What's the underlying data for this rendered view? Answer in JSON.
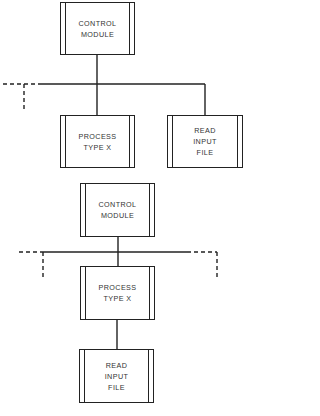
{
  "diagram_1": {
    "root": {
      "lines": [
        "CONTROL",
        "MODULE"
      ]
    },
    "children": [
      {
        "lines": [
          "PROCESS",
          "TYPE X"
        ]
      },
      {
        "lines": [
          "READ",
          "INPUT",
          "FILE"
        ]
      }
    ]
  },
  "diagram_2": {
    "root": {
      "lines": [
        "CONTROL",
        "MODULE"
      ]
    },
    "middle": {
      "lines": [
        "PROCESS",
        "TYPE X"
      ]
    },
    "leaf": {
      "lines": [
        "READ",
        "INPUT",
        "FILE"
      ]
    }
  }
}
